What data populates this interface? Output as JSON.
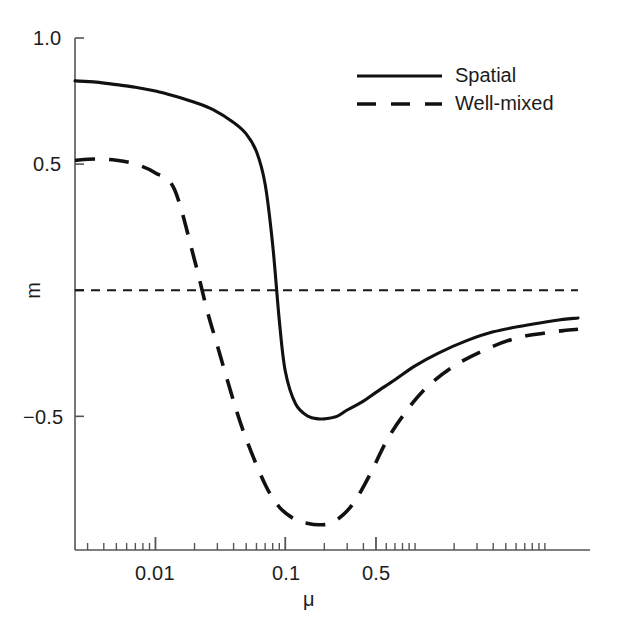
{
  "chart_data": {
    "type": "line",
    "title": "",
    "xlabel": "μ",
    "ylabel": "m",
    "xscale": "log",
    "xlim": [
      0.0024,
      18.0
    ],
    "ylim": [
      -1.03,
      1.0
    ],
    "grid": false,
    "legend_position": "top-right",
    "zero_reference_line": {
      "value": 0,
      "style": "dashed",
      "color": "#1a1a1a"
    },
    "x_tick_labels": [
      "0.01",
      "0.1",
      "0.5"
    ],
    "x_tick_values": [
      0.01,
      0.1,
      0.5
    ],
    "y_tick_labels": [
      "1.0",
      "0.5",
      "−0.5"
    ],
    "y_tick_values": [
      1.0,
      0.5,
      -0.5
    ],
    "series": [
      {
        "name": "Spatial",
        "style": "solid",
        "color": "#111111",
        "x": [
          0.0024,
          0.0035,
          0.005,
          0.007,
          0.01,
          0.014,
          0.02,
          0.028,
          0.04,
          0.05,
          0.06,
          0.07,
          0.08,
          0.09,
          0.1,
          0.12,
          0.15,
          0.18,
          0.2,
          0.25,
          0.3,
          0.4,
          0.5,
          0.7,
          1.0,
          1.5,
          2.5,
          4.0,
          7.0,
          12.0,
          18.0
        ],
        "y": [
          0.83,
          0.825,
          0.815,
          0.805,
          0.79,
          0.77,
          0.745,
          0.715,
          0.665,
          0.62,
          0.55,
          0.42,
          0.18,
          -0.12,
          -0.32,
          -0.45,
          -0.5,
          -0.51,
          -0.51,
          -0.5,
          -0.475,
          -0.44,
          -0.405,
          -0.355,
          -0.3,
          -0.25,
          -0.2,
          -0.165,
          -0.14,
          -0.12,
          -0.11
        ]
      },
      {
        "name": "Well-mixed",
        "style": "dashed",
        "color": "#111111",
        "x": [
          0.0024,
          0.0035,
          0.005,
          0.007,
          0.01,
          0.014,
          0.02,
          0.025,
          0.03,
          0.04,
          0.05,
          0.07,
          0.09,
          0.12,
          0.15,
          0.18,
          0.22,
          0.28,
          0.35,
          0.45,
          0.6,
          0.8,
          1.2,
          2.0,
          3.5,
          6.0,
          10.0,
          14.0,
          18.0
        ],
        "y": [
          0.515,
          0.52,
          0.515,
          0.5,
          0.465,
          0.4,
          0.12,
          -0.08,
          -0.22,
          -0.44,
          -0.59,
          -0.77,
          -0.86,
          -0.91,
          -0.925,
          -0.93,
          -0.925,
          -0.89,
          -0.83,
          -0.73,
          -0.6,
          -0.5,
          -0.39,
          -0.3,
          -0.235,
          -0.19,
          -0.17,
          -0.16,
          -0.155
        ]
      }
    ]
  },
  "legend": {
    "entries": [
      {
        "label": "Spatial",
        "style": "solid"
      },
      {
        "label": "Well-mixed",
        "style": "dashed"
      }
    ]
  },
  "axes": {
    "y_label": "m",
    "x_label": "μ",
    "y_ticks": [
      {
        "label": "1.0",
        "value": 1.0
      },
      {
        "label": "0.5",
        "value": 0.5
      },
      {
        "label": "−0.5",
        "value": -0.5
      }
    ],
    "x_ticks": [
      {
        "label": "0.01",
        "value": 0.01
      },
      {
        "label": "0.1",
        "value": 0.1
      },
      {
        "label": "0.5",
        "value": 0.5
      }
    ]
  }
}
